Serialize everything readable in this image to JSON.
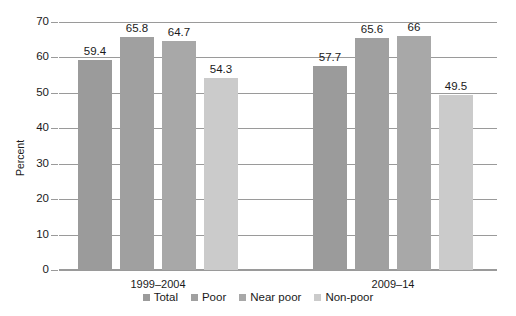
{
  "chart_data": {
    "type": "bar",
    "title": "",
    "xlabel": "",
    "ylabel": "Percent",
    "ylim": [
      0,
      70
    ],
    "ytick_step": 10,
    "yticks": [
      "0",
      "10",
      "20",
      "30",
      "40",
      "50",
      "60",
      "70"
    ],
    "grid": true,
    "legend_position": "bottom",
    "categories": [
      "1999–2004",
      "2009–14"
    ],
    "series": [
      {
        "name": "Total",
        "color": "#9b9b9b",
        "values": [
          59.4,
          57.7
        ]
      },
      {
        "name": "Poor",
        "color": "#a0a0a0",
        "values": [
          65.8,
          65.6
        ]
      },
      {
        "name": "Near poor",
        "color": "#a8a8a8",
        "values": [
          64.7,
          66
        ]
      },
      {
        "name": "Non-poor",
        "color": "#cbcbcb",
        "values": [
          54.3,
          49.5
        ]
      }
    ],
    "value_labels": [
      [
        "59.4",
        "65.8",
        "64.7",
        "54.3"
      ],
      [
        "57.7",
        "65.6",
        "66",
        "49.5"
      ]
    ]
  },
  "legend": {
    "items": [
      {
        "label": "Total",
        "color": "#9b9b9b"
      },
      {
        "label": "Poor",
        "color": "#a0a0a0"
      },
      {
        "label": "Near poor",
        "color": "#a8a8a8"
      },
      {
        "label": "Non-poor",
        "color": "#cbcbcb"
      }
    ]
  },
  "axis": {
    "y_title": "Percent",
    "gridline_color": "#9a9a9a"
  }
}
